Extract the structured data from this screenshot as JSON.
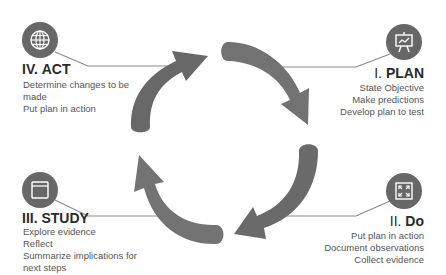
{
  "diagram": {
    "type": "cycle",
    "colors": {
      "arrow": "#6e6e6e",
      "icon_bg": "#676767",
      "line": "#8a8a8a",
      "text": "#555555",
      "title": "#2b2b2b"
    },
    "stages": [
      {
        "id": "plan",
        "number": "I.",
        "name": "PLAN",
        "icon": "presentation-chart-icon",
        "lines": [
          "State Objective",
          "Make predictions",
          "Develop plan to test"
        ]
      },
      {
        "id": "do",
        "number": "II.",
        "name": "Do",
        "icon": "expand-arrows-icon",
        "lines": [
          "Put plan in action",
          "Document observations",
          "Collect evidence"
        ]
      },
      {
        "id": "study",
        "number": "III.",
        "name": "STUDY",
        "icon": "browser-window-icon",
        "lines": [
          "Explore evidence",
          "Reflect",
          "Summarize implications for",
          "next steps"
        ]
      },
      {
        "id": "act",
        "number": "IV.",
        "name": "ACT",
        "icon": "globe-icon",
        "lines": [
          "Determine changes to be",
          "made",
          "Put plan in action"
        ]
      }
    ]
  }
}
